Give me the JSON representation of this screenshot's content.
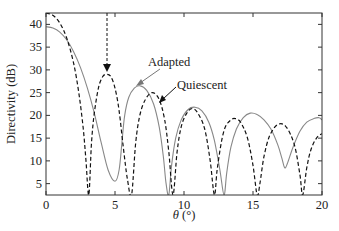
{
  "chart_data": {
    "type": "line",
    "title": "",
    "xlabel": "θ (°)",
    "ylabel": "Directivity (dB)",
    "xlim": [
      0,
      20
    ],
    "ylim": [
      2.5,
      42.5
    ],
    "xticks": [
      0,
      5,
      10,
      15,
      20
    ],
    "yticks": [
      5,
      10,
      15,
      20,
      25,
      30,
      35,
      40
    ],
    "grid": false,
    "legend_position": "annotations",
    "annotations": [
      {
        "text": "Adapted",
        "points_to": [
          6.6,
          26.3
        ]
      },
      {
        "text": "Quiescent",
        "points_to": [
          8.3,
          22.5
        ]
      },
      {
        "text": "jammer-arrow",
        "x": 4.4,
        "from_y": 42.5,
        "to_y": 30
      }
    ],
    "series": [
      {
        "name": "Quiescent",
        "style": "dashed",
        "color": "#111111",
        "x": [
          0,
          0.5,
          1.0,
          1.5,
          2.0,
          2.4,
          2.7,
          2.9,
          3.1,
          3.3,
          3.5,
          3.8,
          4.1,
          4.4,
          4.7,
          5.0,
          5.3,
          5.6,
          5.9,
          6.2,
          6.5,
          6.8,
          7.2,
          7.7,
          8.2,
          8.6,
          8.9,
          9.2,
          9.5,
          9.8,
          10.2,
          10.6,
          11.0,
          11.5,
          11.9,
          12.2,
          12.4,
          12.7,
          13.0,
          13.4,
          13.7,
          14.1,
          14.6,
          15.0,
          15.3,
          15.5,
          15.8,
          16.2,
          16.8,
          17.4,
          18.0,
          18.4,
          18.6,
          18.9,
          19.2,
          19.6,
          20.0
        ],
        "values": [
          42.5,
          42.0,
          40.3,
          37.0,
          31.5,
          24.5,
          17.0,
          10.0,
          2.5,
          14.0,
          20.5,
          26.0,
          28.5,
          29.0,
          28.5,
          26.0,
          21.0,
          13.0,
          6.0,
          2.5,
          14.0,
          20.0,
          23.5,
          25.0,
          23.5,
          19.0,
          12.0,
          2.5,
          12.0,
          17.5,
          20.5,
          21.5,
          20.5,
          17.0,
          10.0,
          2.5,
          8.0,
          14.0,
          17.5,
          19.0,
          19.3,
          18.5,
          15.0,
          9.0,
          2.5,
          5.0,
          11.0,
          15.5,
          18.0,
          17.5,
          13.5,
          7.0,
          2.5,
          8.5,
          12.5,
          15.0,
          16.0
        ]
      },
      {
        "name": "Adapted",
        "style": "solid",
        "color": "#888888",
        "x": [
          0,
          0.5,
          1.0,
          1.5,
          2.0,
          2.5,
          3.0,
          3.5,
          4.0,
          4.5,
          5.0,
          5.3,
          5.5,
          5.7,
          6.0,
          6.4,
          6.8,
          7.3,
          7.8,
          8.2,
          8.5,
          8.7,
          8.9,
          9.1,
          9.4,
          9.8,
          10.3,
          10.8,
          11.3,
          11.8,
          12.2,
          12.6,
          12.9,
          13.1,
          13.4,
          13.8,
          14.3,
          14.8,
          15.3,
          15.8,
          16.3,
          16.8,
          17.1,
          17.3,
          17.5,
          17.9,
          18.4,
          18.9,
          19.4,
          19.8,
          20.0
        ],
        "values": [
          39.5,
          39.2,
          38.3,
          36.6,
          34.0,
          30.5,
          26.0,
          20.5,
          14.0,
          8.0,
          5.5,
          8.0,
          14.0,
          20.0,
          24.0,
          26.0,
          26.5,
          25.5,
          22.5,
          17.5,
          11.0,
          5.0,
          2.5,
          9.0,
          15.0,
          19.0,
          21.3,
          21.8,
          21.0,
          18.5,
          14.5,
          8.0,
          2.5,
          7.5,
          13.0,
          17.0,
          19.5,
          20.5,
          20.2,
          19.0,
          17.0,
          13.5,
          10.5,
          8.5,
          9.5,
          13.0,
          16.5,
          18.5,
          19.3,
          19.5,
          19.0
        ]
      }
    ]
  },
  "labels": {
    "ylabel": "Directivity (dB)",
    "xlabel_theta": "θ",
    "xlabel_unit": " (°)",
    "adapted": "Adapted",
    "quiescent": "Quiescent",
    "xtick_labels": [
      "0",
      "5",
      "10",
      "15",
      "20"
    ],
    "ytick_labels": [
      "5",
      "10",
      "15",
      "20",
      "25",
      "30",
      "35",
      "40"
    ]
  }
}
